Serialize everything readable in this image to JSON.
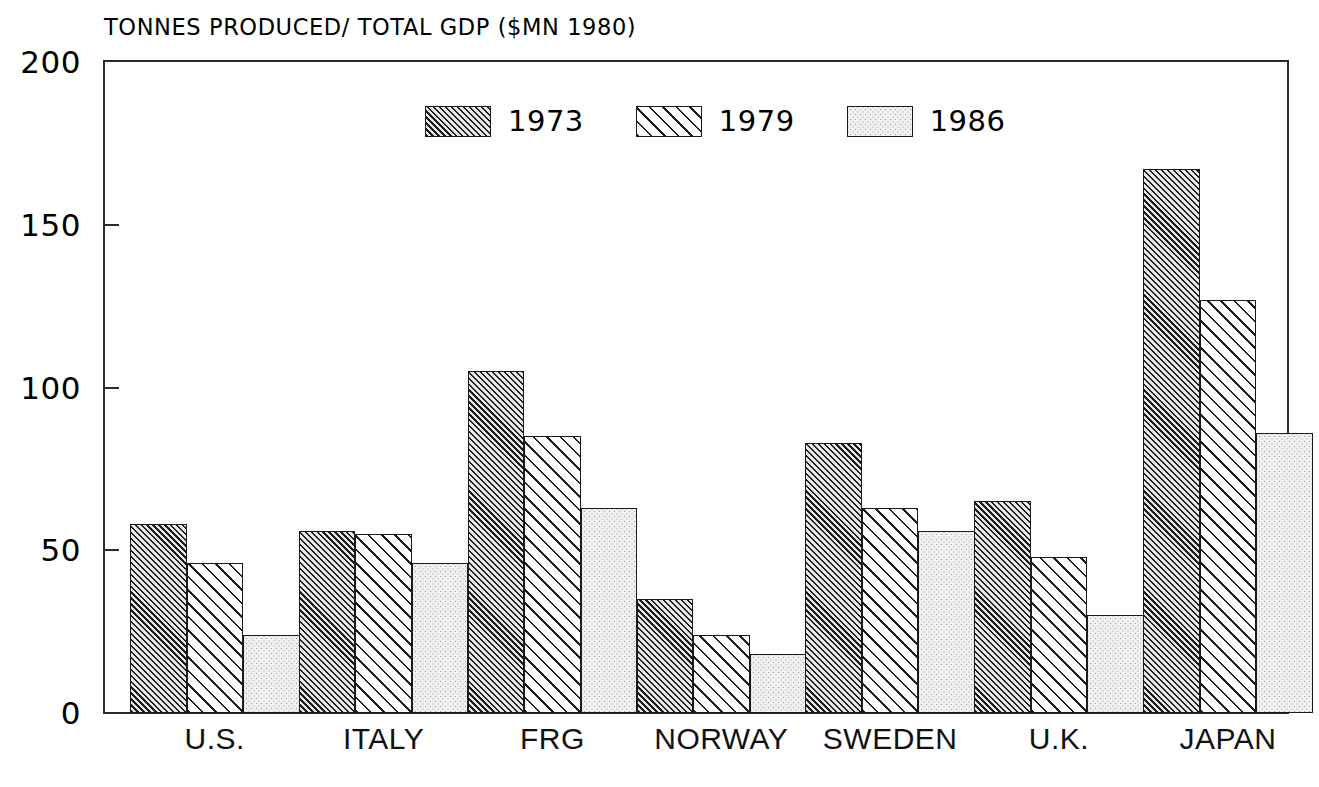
{
  "chart_data": {
    "type": "bar",
    "title": "TONNES PRODUCED/ TOTAL GDP ($MN 1980)",
    "xlabel": "",
    "ylabel": "",
    "ylim": [
      0,
      200
    ],
    "ytick_labels": [
      "0",
      "50",
      "100",
      "150",
      "200"
    ],
    "yticks": [
      0,
      50,
      100,
      150,
      200
    ],
    "grid": false,
    "legend_position": "top-center",
    "categories": [
      "U.S.",
      "ITALY",
      "FRG",
      "NORWAY",
      "SWEDEN",
      "U.K.",
      "JAPAN"
    ],
    "series": [
      {
        "name": "1973",
        "pattern": "dense-diagonal-hatch",
        "values": [
          58,
          56,
          105,
          35,
          83,
          65,
          167
        ]
      },
      {
        "name": "1979",
        "pattern": "wide-diagonal-hatch",
        "values": [
          46,
          55,
          85,
          24,
          63,
          48,
          127
        ]
      },
      {
        "name": "1986",
        "pattern": "light-stipple",
        "values": [
          24,
          46,
          63,
          18,
          56,
          30,
          86
        ]
      }
    ],
    "colors": {
      "axis": "#2b2b2b",
      "bar_outline": "#1a1a1a",
      "series_1973": "#808080",
      "series_1979": "#f2f2f2",
      "series_1986": "#f0f0f0",
      "background": "#ffffff",
      "text": "#000000"
    }
  },
  "legend": {
    "items": [
      {
        "label": "1973"
      },
      {
        "label": "1979"
      },
      {
        "label": "1986"
      }
    ]
  }
}
